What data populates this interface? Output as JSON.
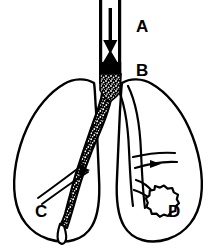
{
  "figure": {
    "background_color": "#ffffff",
    "ink_color": "#000000",
    "width": 213,
    "height": 249,
    "labels": [
      {
        "id": "A",
        "text": "A",
        "target": "trachea-upper-airway"
      },
      {
        "id": "B",
        "text": "B",
        "target": "lower-trachea-obstruction"
      },
      {
        "id": "C",
        "text": "C",
        "target": "left-lung"
      },
      {
        "id": "D",
        "text": "D",
        "target": "right-lung-nodule"
      }
    ],
    "structures": {
      "trachea": "vertical-tube",
      "airflow_down_arrow": "down-arrow-icon",
      "airflow_up_arrow": "up-arrow-icon",
      "carina": "bronchial-bifurcation",
      "left_main_bronchus": "stippled-thickened-bronchus",
      "right_main_bronchus": "open-bronchus",
      "right_lung_mass": "scalloped-nodule",
      "left_lung_outline": "lung-silhouette",
      "right_lung_outline": "lung-silhouette"
    }
  }
}
